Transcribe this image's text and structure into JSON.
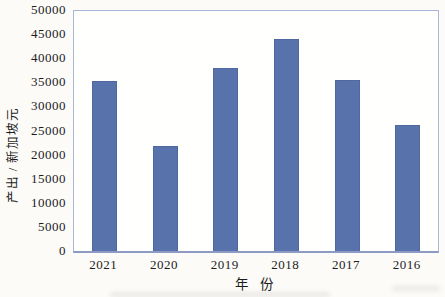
{
  "chart_data": {
    "type": "bar",
    "title": "",
    "categories": [
      "2021",
      "2020",
      "2019",
      "2018",
      "2017",
      "2016"
    ],
    "values": [
      35300,
      21800,
      37900,
      43900,
      35400,
      26100
    ],
    "xlabel": "年  份",
    "ylabel": "产出 / 新加坡元",
    "ylim": [
      0,
      50000
    ],
    "ytick_step": 5000,
    "ytick_labels": [
      "0",
      "5000",
      "10000",
      "15000",
      "20000",
      "25000",
      "30000",
      "35000",
      "40000",
      "45000",
      "50000"
    ],
    "grid": false,
    "legend": "none",
    "bar_width_px": 25,
    "bar_color": "#5873ab",
    "bar_edge_color": "#4f699f",
    "frame_color": "#aab6d8",
    "axis_color": "#8c9ac4",
    "text_color": "#1c1c1c",
    "plot_background": "#fffffe",
    "figure_background": "#fcfbf8"
  }
}
